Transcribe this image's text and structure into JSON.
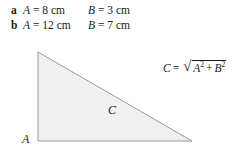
{
  "answers": {
    "rows": [
      {
        "marker": "a",
        "left_var": "A",
        "left_eq": "= 8 cm",
        "right_var": "B",
        "right_eq": "= 3 cm"
      },
      {
        "marker": "b",
        "left_var": "A",
        "left_eq": "= 12 cm",
        "right_var": "B",
        "right_eq": "= 7 cm"
      }
    ]
  },
  "figure": {
    "shape": "right-triangle",
    "fill_color": "#f0f0f0",
    "stroke_color": "#9a9a9a",
    "labels": {
      "vertical_side": "A",
      "horizontal_side": "B",
      "hypotenuse": "C"
    }
  },
  "formula": {
    "result_var": "C",
    "equals": "=",
    "radical_sign": "√",
    "term_a": "A",
    "exponent_a": "2",
    "plus": "+",
    "term_b": "B",
    "exponent_b": "2"
  }
}
